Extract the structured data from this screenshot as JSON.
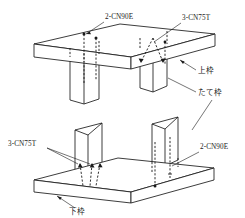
{
  "figure": {
    "line_color": "#1a1a1a",
    "background": "#ffffff"
  },
  "labels": {
    "top_left_callout": "2-CN90E",
    "top_right_callout": "3-CN75T",
    "bottom_left_callout": "3-CN75T",
    "bottom_right_callout": "2-CN90E",
    "upper_plate": "上枠",
    "stud": "たて枠",
    "lower_plate": "下枠"
  },
  "assemblies": [
    {
      "name": "upper-assembly",
      "plate_label": "上枠",
      "members": [
        "upper-plate",
        "stud-left",
        "stud-right"
      ],
      "nailing": [
        {
          "location": "left-stud",
          "spec": "2-CN90E",
          "type": "end-nail",
          "count": 2
        },
        {
          "location": "right-stud",
          "spec": "3-CN75T",
          "type": "toe-nail",
          "count": 3
        }
      ]
    },
    {
      "name": "lower-assembly",
      "plate_label": "下枠",
      "members": [
        "lower-plate",
        "stud-left",
        "stud-right"
      ],
      "nailing": [
        {
          "location": "left-stud",
          "spec": "3-CN75T",
          "type": "toe-nail",
          "count": 3
        },
        {
          "location": "right-stud",
          "spec": "2-CN90E",
          "type": "end-nail",
          "count": 2
        }
      ]
    }
  ]
}
